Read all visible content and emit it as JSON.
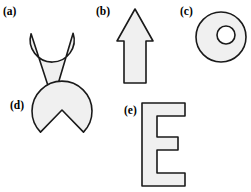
{
  "figure": {
    "kind": "shape-panel-figure",
    "background_color": "#ffffff",
    "shape_fill_color": "#f0f0f0",
    "shape_stroke_color": "#1a1a1a",
    "shape_stroke_width": 1.6,
    "canvas": {
      "width": 251,
      "height": 192
    }
  },
  "panels": [
    {
      "id": "a",
      "label": "(a)",
      "shape_name": "teardrop-point-down",
      "description": "Teardrop with rounded top and downward point",
      "geometry": {
        "circle_center_x": 52,
        "circle_center_y": 27,
        "circle_radius": 22,
        "point_x": 53,
        "point_y": 101
      }
    },
    {
      "id": "b",
      "label": "(b)",
      "shape_name": "arrow-up",
      "description": "Upward arrow with triangular head and rectangular shaft",
      "geometry": {
        "tip_x": 135,
        "tip_y": 9,
        "head_left_x": 117,
        "head_right_x": 153,
        "head_base_y": 41,
        "shaft_left_x": 124,
        "shaft_right_x": 146,
        "shaft_bottom_y": 83
      }
    },
    {
      "id": "c",
      "label": "(c)",
      "shape_name": "annulus-ring",
      "description": "Ring with off-center circular hole",
      "geometry": {
        "outer_center_x": 221,
        "outer_center_y": 37,
        "outer_radius": 25,
        "inner_center_x": 226,
        "inner_center_y": 35,
        "inner_radius": 9
      }
    },
    {
      "id": "d",
      "label": "(d)",
      "shape_name": "teardrop-point-up",
      "description": "Inverted teardrop with upward point and rounded bottom",
      "geometry": {
        "point_x": 62,
        "point_y": 110,
        "circle_center_x": 62,
        "circle_center_y": 153,
        "circle_radius": 30
      }
    },
    {
      "id": "e",
      "label": "(e)",
      "shape_name": "block-letter-e",
      "description": "Block capital letter E",
      "geometry": {
        "left_x": 142,
        "right_x": 185,
        "top_y": 103,
        "bottom_y": 186,
        "stem_width": 15,
        "arm_thickness": 13,
        "middle_arm_right_x": 178,
        "middle_arm_top_y": 137,
        "middle_arm_bottom_y": 150
      }
    }
  ]
}
